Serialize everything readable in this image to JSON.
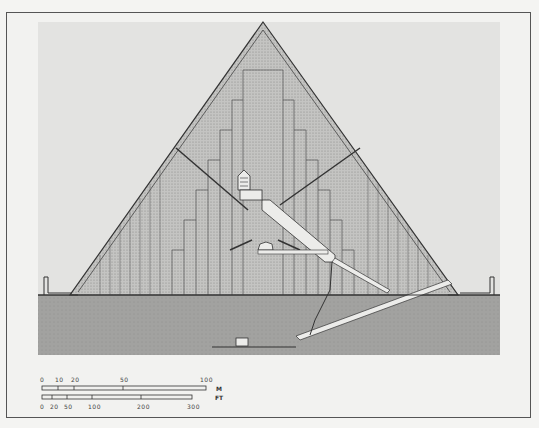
{
  "figure": {
    "colors": {
      "background": "#f2f2f0",
      "sky_panel": "#e2e2e0",
      "pyramid_fill": "#bdbdbb",
      "bedrock_fill": "#9a9a98",
      "line": "#333333",
      "passage": "#ececea"
    }
  },
  "scale_bars": {
    "meters": {
      "unit_label": "M",
      "ticks": [
        {
          "value": 0,
          "label": "0"
        },
        {
          "value": 10,
          "label": "10"
        },
        {
          "value": 20,
          "label": "20"
        },
        {
          "value": 50,
          "label": "50"
        },
        {
          "value": 100,
          "label": "100"
        }
      ]
    },
    "feet": {
      "unit_label": "FT",
      "ticks": [
        {
          "value": 0,
          "label": "0"
        },
        {
          "value": 20,
          "label": "20"
        },
        {
          "value": 50,
          "label": "50"
        },
        {
          "value": 100,
          "label": "100"
        },
        {
          "value": 200,
          "label": "200"
        },
        {
          "value": 300,
          "label": "300"
        }
      ]
    }
  }
}
